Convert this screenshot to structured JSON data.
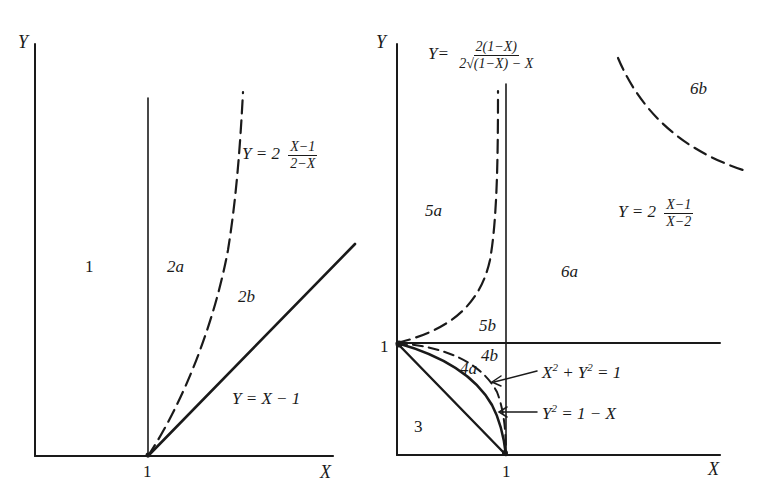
{
  "left_panel": {
    "axis_y_label": "Y",
    "axis_x_label": "X",
    "tick_x_1": "1",
    "regions": {
      "r1": "1",
      "r2a": "2a",
      "r2b": "2b"
    },
    "curve_dashed": {
      "lhs": "Y = 2",
      "num": "X−1",
      "den": "2−X"
    },
    "curve_solid": {
      "text": "Y = X − 1"
    }
  },
  "right_panel": {
    "axis_y_label": "Y",
    "axis_x_label": "X",
    "tick_x_1": "1",
    "tick_y_1": "1",
    "regions": {
      "r3": "3",
      "r4a": "4a",
      "r4b": "4b",
      "r5a": "5a",
      "r5b": "5b",
      "r6a": "6a",
      "r6b": "6b"
    },
    "curve_5": {
      "lhs": "Y=",
      "num": "2(1−X)",
      "den": "2√(1−X) − X"
    },
    "curve_6": {
      "lhs": "Y = 2",
      "num": "X−1",
      "den": "X−2"
    },
    "circle": {
      "text_a": "X",
      "text_b": " + Y",
      "text_c": " = 1",
      "sup": "2"
    },
    "parabola": {
      "text_a": "Y",
      "text_b": " = 1 − X",
      "sup": "2"
    }
  },
  "colors": {
    "ink": "#1a1a1a",
    "background": "#ffffff"
  }
}
